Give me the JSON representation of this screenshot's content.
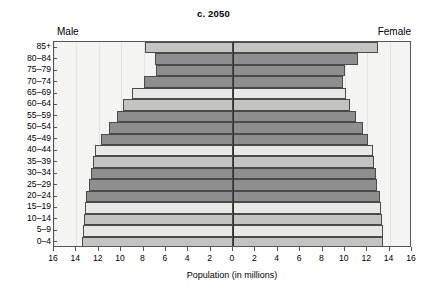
{
  "chart_data": {
    "type": "bar",
    "subtype": "population-pyramid",
    "title": "c. 2050",
    "xlabel": "Population (in millions)",
    "ylabel": "",
    "left_series_label": "Male",
    "right_series_label": "Female",
    "xlim": [
      -16,
      16
    ],
    "xticks": [
      16,
      14,
      12,
      10,
      8,
      6,
      4,
      2,
      0,
      2,
      4,
      6,
      8,
      10,
      12,
      14,
      16
    ],
    "xtick_labels": [
      "16",
      "14",
      "12",
      "10",
      "8",
      "6",
      "4",
      "2",
      "0",
      "2",
      "4",
      "6",
      "8",
      "10",
      "12",
      "14",
      "16"
    ],
    "grid": true,
    "legend": "none",
    "categories": [
      "85+",
      "80–84",
      "75–79",
      "70–74",
      "65–69",
      "60–64",
      "55–59",
      "50–54",
      "45–49",
      "40–44",
      "35–39",
      "30–34",
      "25–29",
      "20–24",
      "15–19",
      "10–14",
      "5–9",
      "0–4"
    ],
    "series": [
      {
        "name": "Male",
        "side": "left",
        "values": [
          7.9,
          7.0,
          6.9,
          8.0,
          9.0,
          9.8,
          10.4,
          11.1,
          11.8,
          12.3,
          12.5,
          12.7,
          12.9,
          13.1,
          13.2,
          13.3,
          13.4,
          13.5
        ]
      },
      {
        "name": "Female",
        "side": "right",
        "values": [
          13.0,
          11.2,
          10.0,
          9.8,
          10.1,
          10.5,
          11.0,
          11.6,
          12.1,
          12.5,
          12.6,
          12.8,
          12.9,
          13.1,
          13.2,
          13.3,
          13.4,
          13.4
        ]
      }
    ],
    "bar_shades": [
      "mid",
      "dark",
      "dark",
      "dark",
      "light",
      "mid",
      "dark",
      "dark",
      "dark",
      "light",
      "mid",
      "dark",
      "dark",
      "dark",
      "light",
      "mid",
      "light",
      "mid"
    ],
    "colors": {
      "light": "#e8e8e6",
      "mid": "#c3c3c1",
      "dark": "#8e8e8e",
      "outline": "#4a4a4a",
      "axis": "#303030",
      "plot_background": "#f4f4f2"
    }
  }
}
